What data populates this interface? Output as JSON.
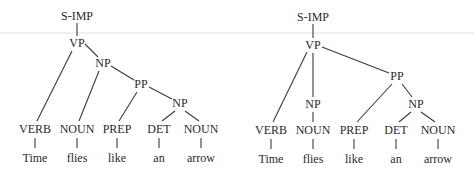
{
  "figure": {
    "trees": [
      {
        "id": "tree-left",
        "nodes": [
          {
            "id": "s",
            "label": "S-IMP",
            "x": 77,
            "y": 20
          },
          {
            "id": "vp",
            "label": "VP",
            "x": 77,
            "y": 47
          },
          {
            "id": "np1",
            "label": "NP",
            "x": 103,
            "y": 67
          },
          {
            "id": "pp",
            "label": "PP",
            "x": 141,
            "y": 88
          },
          {
            "id": "np2",
            "label": "NP",
            "x": 180,
            "y": 107
          },
          {
            "id": "verb",
            "label": "VERB",
            "x": 35,
            "y": 133
          },
          {
            "id": "noun1",
            "label": "NOUN",
            "x": 77,
            "y": 133
          },
          {
            "id": "prep",
            "label": "PREP",
            "x": 117,
            "y": 133
          },
          {
            "id": "det",
            "label": "DET",
            "x": 159,
            "y": 133
          },
          {
            "id": "noun2",
            "label": "NOUN",
            "x": 201,
            "y": 133
          }
        ],
        "words": [
          {
            "parent": "verb",
            "text": "Time",
            "x": 35,
            "y": 162
          },
          {
            "parent": "noun1",
            "text": "flies",
            "x": 77,
            "y": 162
          },
          {
            "parent": "prep",
            "text": "like",
            "x": 117,
            "y": 162
          },
          {
            "parent": "det",
            "text": "an",
            "x": 159,
            "y": 162
          },
          {
            "parent": "noun2",
            "text": "arrow",
            "x": 201,
            "y": 162
          }
        ],
        "edges": [
          {
            "from": [
              77,
              23
            ],
            "to": [
              77,
              36
            ]
          },
          {
            "from": [
              72,
              51
            ],
            "to": [
              37,
              121
            ]
          },
          {
            "from": [
              85,
              44
            ],
            "to": [
              98,
              57
            ]
          },
          {
            "from": [
              99,
              71
            ],
            "to": [
              79,
              121
            ]
          },
          {
            "from": [
              111,
              66
            ],
            "to": [
              134,
              80
            ]
          },
          {
            "from": [
              137,
              92
            ],
            "to": [
              119,
              121
            ]
          },
          {
            "from": [
              149,
              87
            ],
            "to": [
              172,
              99
            ]
          },
          {
            "from": [
              175,
              111
            ],
            "to": [
              162,
              121
            ]
          },
          {
            "from": [
              185,
              111
            ],
            "to": [
              199,
              121
            ]
          },
          {
            "from": [
              35,
              138
            ],
            "to": [
              35,
              148
            ]
          },
          {
            "from": [
              77,
              138
            ],
            "to": [
              77,
              148
            ]
          },
          {
            "from": [
              117,
              138
            ],
            "to": [
              117,
              148
            ]
          },
          {
            "from": [
              159,
              138
            ],
            "to": [
              159,
              148
            ]
          },
          {
            "from": [
              201,
              138
            ],
            "to": [
              201,
              148
            ]
          }
        ]
      },
      {
        "id": "tree-right",
        "nodes": [
          {
            "id": "s",
            "label": "S-IMP",
            "x": 313,
            "y": 21
          },
          {
            "id": "vp",
            "label": "VP",
            "x": 313,
            "y": 49
          },
          {
            "id": "pp",
            "label": "PP",
            "x": 397,
            "y": 80
          },
          {
            "id": "np1",
            "label": "NP",
            "x": 313,
            "y": 108
          },
          {
            "id": "np2",
            "label": "NP",
            "x": 416,
            "y": 108
          },
          {
            "id": "verb",
            "label": "VERB",
            "x": 271,
            "y": 134
          },
          {
            "id": "noun1",
            "label": "NOUN",
            "x": 313,
            "y": 134
          },
          {
            "id": "prep",
            "label": "PREP",
            "x": 354,
            "y": 134
          },
          {
            "id": "det",
            "label": "DET",
            "x": 396,
            "y": 134
          },
          {
            "id": "noun2",
            "label": "NOUN",
            "x": 438,
            "y": 134
          }
        ],
        "words": [
          {
            "parent": "verb",
            "text": "Time",
            "x": 271,
            "y": 163
          },
          {
            "parent": "noun1",
            "text": "flies",
            "x": 313,
            "y": 163
          },
          {
            "parent": "prep",
            "text": "like",
            "x": 354,
            "y": 163
          },
          {
            "parent": "det",
            "text": "an",
            "x": 396,
            "y": 163
          },
          {
            "parent": "noun2",
            "text": "arrow",
            "x": 438,
            "y": 163
          }
        ],
        "edges": [
          {
            "from": [
              313,
              24
            ],
            "to": [
              313,
              38
            ]
          },
          {
            "from": [
              307,
              52
            ],
            "to": [
              273,
              122
            ]
          },
          {
            "from": [
              313,
              53
            ],
            "to": [
              313,
              97
            ]
          },
          {
            "from": [
              322,
              47
            ],
            "to": [
              389,
              73
            ]
          },
          {
            "from": [
              313,
              112
            ],
            "to": [
              313,
              122
            ]
          },
          {
            "from": [
              392,
              84
            ],
            "to": [
              357,
              122
            ]
          },
          {
            "from": [
              402,
              84
            ],
            "to": [
              412,
              97
            ]
          },
          {
            "from": [
              411,
              112
            ],
            "to": [
              399,
              122
            ]
          },
          {
            "from": [
              421,
              112
            ],
            "to": [
              435,
              122
            ]
          },
          {
            "from": [
              271,
              139
            ],
            "to": [
              271,
              149
            ]
          },
          {
            "from": [
              313,
              139
            ],
            "to": [
              313,
              149
            ]
          },
          {
            "from": [
              354,
              139
            ],
            "to": [
              354,
              149
            ]
          },
          {
            "from": [
              396,
              139
            ],
            "to": [
              396,
              149
            ]
          },
          {
            "from": [
              438,
              139
            ],
            "to": [
              438,
              149
            ]
          }
        ]
      }
    ]
  }
}
